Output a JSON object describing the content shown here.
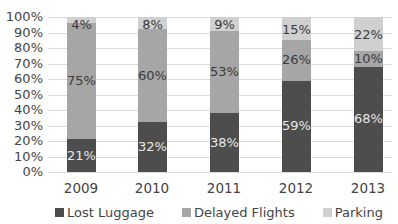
{
  "chart_data": {
    "type": "bar",
    "stacked": true,
    "title": "",
    "xlabel": "",
    "ylabel": "",
    "categories": [
      "2009",
      "2010",
      "2011",
      "2012",
      "2013"
    ],
    "series": [
      {
        "name": "Lost Luggage",
        "color": "#4d4d4d",
        "values": [
          21,
          32,
          38,
          59,
          68
        ],
        "labels": [
          "21%",
          "32%",
          "38%",
          "59%",
          "68%"
        ]
      },
      {
        "name": "Delayed Flights",
        "color": "#a6a6a6",
        "values": [
          75,
          60,
          53,
          26,
          10
        ],
        "labels": [
          "75%",
          "60%",
          "53%",
          "26%",
          "10%"
        ]
      },
      {
        "name": "Parking",
        "color": "#d0d0d0",
        "values": [
          4,
          8,
          9,
          15,
          22
        ],
        "labels": [
          "4%",
          "8%",
          "9%",
          "15%",
          "22%"
        ]
      }
    ],
    "ylim": [
      0,
      100
    ],
    "yticks": [
      "0%",
      "10%",
      "20%",
      "30%",
      "40%",
      "50%",
      "60%",
      "70%",
      "80%",
      "90%",
      "100%"
    ],
    "grid": true,
    "legend_position": "bottom"
  }
}
